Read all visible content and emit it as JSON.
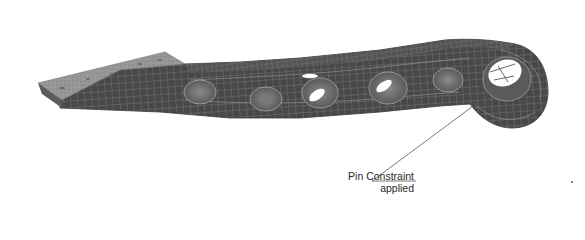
{
  "figure": {
    "background": "#ffffff",
    "colors": {
      "mesh_body": "#4a4a4a",
      "mesh_lines": "#9a9a9a",
      "tab_plate": "#8f8f8f",
      "hole_interior": "#ffffff",
      "leader_line": "#555555",
      "label_text": "#2a2a2a"
    },
    "holes": [
      {
        "name": "hole-1",
        "cx": 200,
        "cy": 92
      },
      {
        "name": "hole-2",
        "cx": 266,
        "cy": 99
      },
      {
        "name": "hole-3",
        "cx": 320,
        "cy": 93
      },
      {
        "name": "hole-4",
        "cx": 388,
        "cy": 85
      },
      {
        "name": "hole-5",
        "cx": 448,
        "cy": 80
      },
      {
        "name": "pin-hole",
        "cx": 505,
        "cy": 73
      }
    ]
  },
  "callout": {
    "line1": "Pin Constraint",
    "line2": "applied",
    "target": "pin-hole"
  }
}
